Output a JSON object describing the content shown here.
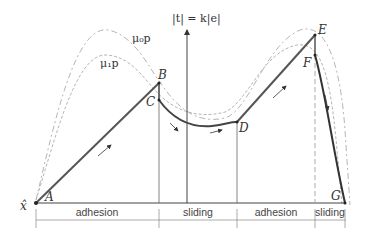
{
  "diagram": {
    "axis_label": "|t| = k|e|",
    "origin_label": "x̂",
    "curves": {
      "upper_limit": "μ₀p",
      "lower_limit": "μ₁p"
    },
    "points": {
      "A": "A",
      "B": "B",
      "C": "C",
      "D": "D",
      "E": "E",
      "F": "F",
      "G": "G"
    },
    "regions": [
      {
        "label": "adhesion"
      },
      {
        "label": "sliding"
      },
      {
        "label": "adhesion"
      },
      {
        "label": "sliding"
      }
    ],
    "colors": {
      "path": "#555555",
      "dashed": "#aaaaaa",
      "axis": "#444444"
    }
  }
}
